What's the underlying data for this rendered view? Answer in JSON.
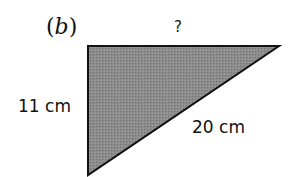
{
  "figure": {
    "part_label": "(b)",
    "shape": "right-triangle",
    "fill_color": "#8a8a8a",
    "stroke_color": "#111111",
    "vertices": {
      "right_angle": [
        88,
        46
      ],
      "top_right": [
        279,
        46
      ],
      "bottom": [
        88,
        175
      ]
    },
    "sides": {
      "top": {
        "label": "?",
        "meaning": "unknown side"
      },
      "left": {
        "label": "11 cm",
        "value": 11,
        "unit": "cm"
      },
      "hypotenuse": {
        "label": "20 cm",
        "value": 20,
        "unit": "cm"
      }
    }
  }
}
